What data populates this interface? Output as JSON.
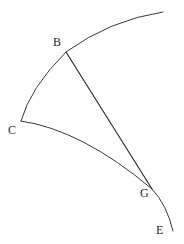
{
  "figure": {
    "background_color": "#ffffff",
    "stroke_color": "#3a3a3a",
    "label_color": "#2b2b2b",
    "stroke_width": 1,
    "width": 184,
    "height": 244
  },
  "labels": {
    "B": "B",
    "C": "C",
    "G": "G",
    "E": "E"
  },
  "points": {
    "B": {
      "x": 66,
      "y": 52
    },
    "C": {
      "x": 21,
      "y": 121
    },
    "G": {
      "x": 152,
      "y": 189
    },
    "E": {
      "x": 173,
      "y": 231
    }
  },
  "strokes": {
    "arc_upper": {
      "name": "arc-C-through-B-to-top-right",
      "d": "M 21 121 Q 30 88 66 52 Q 110 20 163 12",
      "from": "C",
      "through": "B",
      "to": "top-right-end"
    },
    "arc_lower": {
      "name": "arc-C-through-G-to-E",
      "d": "M 21 121 Q 82 130 152 189 Q 167 205 173 231",
      "from": "C",
      "through": "G",
      "to": "E"
    },
    "chord_BG": {
      "name": "segment-B-to-G",
      "x1": 66,
      "y1": 52,
      "x2": 152,
      "y2": 189,
      "from": "B",
      "to": "G"
    }
  }
}
